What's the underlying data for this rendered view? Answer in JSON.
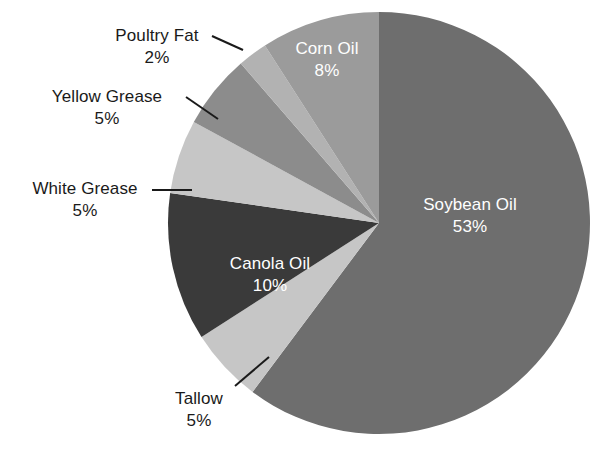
{
  "chart_data": {
    "type": "pie",
    "title": "",
    "unit": "%",
    "legend_position": "none",
    "grid": false,
    "center": {
      "x": 379,
      "y": 223
    },
    "radius": 211,
    "start_angle_deg": 0,
    "direction": "clockwise",
    "categories": [
      "Soybean Oil",
      "Tallow",
      "Canola Oil",
      "White Grease",
      "Yellow Grease",
      "Poultry Fat",
      "Corn Oil"
    ],
    "values": [
      53,
      5,
      10,
      5,
      5,
      2,
      8
    ],
    "slices": [
      {
        "name": "Soybean Oil",
        "label": "Soybean Oil",
        "value": 53,
        "value_text": "53%",
        "color": "#6e6e6e",
        "label_placement": "inside",
        "label_color": "#ffffff"
      },
      {
        "name": "Tallow",
        "label": "Tallow",
        "value": 5,
        "value_text": "5%",
        "color": "#c6c6c6",
        "label_placement": "outside",
        "label_color": "#1a1a1a",
        "leader": {
          "x1": 235,
          "y1": 386,
          "x2": 269,
          "y2": 357
        }
      },
      {
        "name": "Canola Oil",
        "label": "Canola Oil",
        "value": 10,
        "value_text": "10%",
        "color": "#3a3a3a",
        "label_placement": "inside",
        "label_color": "#ffffff"
      },
      {
        "name": "White Grease",
        "label": "White Grease",
        "value": 5,
        "value_text": "5%",
        "color": "#c6c6c6",
        "label_placement": "outside",
        "label_color": "#1a1a1a",
        "leader": {
          "x1": 152,
          "y1": 190,
          "x2": 192,
          "y2": 190
        }
      },
      {
        "name": "Yellow Grease",
        "label": "Yellow Grease",
        "value": 5,
        "value_text": "5%",
        "color": "#8c8c8c",
        "label_placement": "outside",
        "label_color": "#1a1a1a",
        "leader": {
          "x1": 186,
          "y1": 97,
          "x2": 218,
          "y2": 119
        }
      },
      {
        "name": "Poultry Fat",
        "label": "Poultry Fat",
        "value": 2,
        "value_text": "2%",
        "color": "#b2b2b2",
        "label_placement": "outside",
        "label_color": "#1a1a1a",
        "leader": {
          "x1": 212,
          "y1": 36,
          "x2": 243,
          "y2": 50
        }
      },
      {
        "name": "Corn Oil",
        "label": "Corn Oil",
        "value": 8,
        "value_text": "8%",
        "color": "#9b9b9b",
        "label_placement": "inside",
        "label_color": "#ffffff"
      }
    ],
    "background_color": "#ffffff",
    "leader_line_color": "#1a1a1a"
  }
}
